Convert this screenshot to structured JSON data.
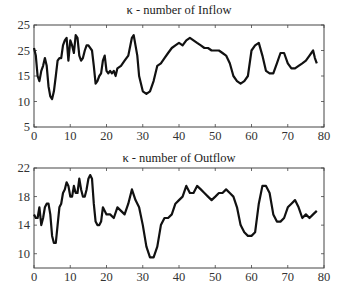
{
  "chart_data": [
    {
      "type": "line",
      "title": "κ - number of Inflow",
      "xlabel": "",
      "ylabel": "",
      "xlim": [
        0,
        80
      ],
      "ylim": [
        5,
        25
      ],
      "grid": false,
      "legend": null,
      "x_ticks": [
        "0",
        "10",
        "20",
        "30",
        "40",
        "50",
        "60",
        "70",
        "80"
      ],
      "y_ticks": [
        {
          "value": 25,
          "label": "25"
        },
        {
          "value": 20,
          "label": "25"
        },
        {
          "value": 15,
          "label": "15"
        },
        {
          "value": 10,
          "label": "10"
        },
        {
          "value": 5,
          "label": "5"
        }
      ],
      "series": [
        {
          "name": "Inflow",
          "x": [
            0,
            0.5,
            1,
            1.5,
            2,
            2.5,
            3,
            3.5,
            4,
            4.5,
            5,
            5.5,
            6,
            6.5,
            7,
            7.5,
            8,
            8.5,
            9,
            9.5,
            10,
            10.5,
            11,
            11.5,
            12,
            12.5,
            13,
            13.5,
            14,
            14.5,
            15,
            16,
            16.5,
            17,
            17.5,
            18,
            18.5,
            19,
            19.5,
            20,
            20.5,
            21,
            21.5,
            22,
            22.5,
            23,
            24,
            25,
            26,
            27,
            27.5,
            28,
            28.5,
            29,
            30,
            31,
            32,
            33,
            34,
            35,
            36,
            37,
            38,
            39,
            40,
            41,
            42,
            43,
            44,
            45,
            46,
            47,
            48,
            49,
            50,
            51,
            52,
            53,
            54,
            55,
            56,
            57,
            58,
            59,
            60,
            61,
            62,
            63,
            64,
            65,
            66,
            67,
            68,
            69,
            70,
            71,
            72,
            73,
            74,
            75,
            76,
            77,
            77.5,
            78
          ],
          "values": [
            20.5,
            19,
            15,
            14,
            16,
            17,
            18.5,
            17,
            13,
            11,
            10.5,
            12,
            15,
            18,
            18.5,
            18.5,
            21,
            22,
            22.5,
            18,
            22,
            21,
            19.5,
            23,
            22.5,
            19,
            18,
            18.5,
            20,
            21,
            21,
            20,
            17,
            13.5,
            14,
            15,
            15.5,
            18,
            19,
            16,
            15.5,
            16,
            15.5,
            16,
            15,
            16.5,
            17,
            18,
            19,
            22.5,
            23,
            21,
            19,
            15,
            12,
            11.5,
            12,
            14,
            17,
            17.5,
            18.5,
            19.5,
            20.5,
            21,
            21.5,
            21,
            22,
            22.5,
            22,
            21.5,
            21,
            20.5,
            20.5,
            20,
            20,
            20,
            19.5,
            19,
            17.5,
            15,
            14,
            13.5,
            14,
            15,
            20,
            21,
            21.5,
            19,
            16,
            15.5,
            15.5,
            17.5,
            19.5,
            19.5,
            17.5,
            16.5,
            16.5,
            17,
            17.5,
            18,
            19,
            20,
            18.5,
            17.5
          ]
        }
      ]
    },
    {
      "type": "line",
      "title": "κ - number of Outflow",
      "xlabel": "",
      "ylabel": "",
      "xlim": [
        0,
        80
      ],
      "ylim": [
        8,
        22
      ],
      "grid": false,
      "legend": null,
      "x_ticks": [
        "0",
        "10",
        "20",
        "30",
        "40",
        "50",
        "60",
        "70",
        "80"
      ],
      "y_ticks": [
        {
          "value": 22,
          "label": "22"
        },
        {
          "value": 18,
          "label": "18"
        },
        {
          "value": 14,
          "label": "14"
        },
        {
          "value": 10,
          "label": "10"
        }
      ],
      "series": [
        {
          "name": "Outflow",
          "x": [
            0,
            0.5,
            1,
            1.5,
            2,
            2.5,
            3,
            3.5,
            4,
            4.5,
            5,
            5.5,
            6,
            6.5,
            7,
            7.5,
            8,
            8.5,
            9,
            9.5,
            10,
            10.5,
            11,
            11.5,
            12,
            12.5,
            13,
            13.5,
            14,
            14.5,
            15,
            15.5,
            16,
            16.5,
            17,
            17.5,
            18,
            18.5,
            19,
            20,
            21,
            22,
            23,
            24,
            25,
            26,
            27,
            28,
            29,
            30,
            31,
            32,
            33,
            34,
            35,
            36,
            37,
            38,
            39,
            40,
            41,
            42,
            43,
            44,
            45,
            46,
            47,
            48,
            49,
            50,
            51,
            52,
            53,
            54,
            55,
            56,
            57,
            58,
            59,
            60,
            61,
            62,
            63,
            64,
            65,
            66,
            67,
            68,
            69,
            70,
            71,
            72,
            73,
            74,
            75,
            76,
            77,
            78
          ],
          "values": [
            15.5,
            15,
            15,
            16.5,
            14,
            15,
            16.5,
            17,
            17,
            15.5,
            12.5,
            11.5,
            11.5,
            14,
            16.5,
            17,
            18.5,
            19,
            20,
            19.5,
            18,
            18,
            19.5,
            18.5,
            18.5,
            20.5,
            19,
            18,
            18,
            19,
            20.5,
            21,
            20.5,
            17,
            14.5,
            14,
            14,
            14.5,
            16.5,
            15.5,
            15.5,
            15,
            16.5,
            16,
            15.5,
            17,
            19,
            17.5,
            16.5,
            14,
            11,
            9.5,
            9.5,
            11,
            14,
            15,
            15,
            15.5,
            17,
            17.5,
            18,
            19.5,
            18.5,
            18.5,
            19.5,
            19,
            18.5,
            18,
            17.5,
            18,
            18.5,
            18.5,
            19,
            18.5,
            18,
            16.5,
            14,
            13,
            12.5,
            12.5,
            13,
            17,
            19.5,
            19.5,
            18.5,
            15.5,
            14.5,
            14.5,
            15,
            16.5,
            17,
            17.5,
            16.5,
            15,
            15.5,
            15,
            15.5,
            16,
            17
          ]
        }
      ]
    }
  ]
}
